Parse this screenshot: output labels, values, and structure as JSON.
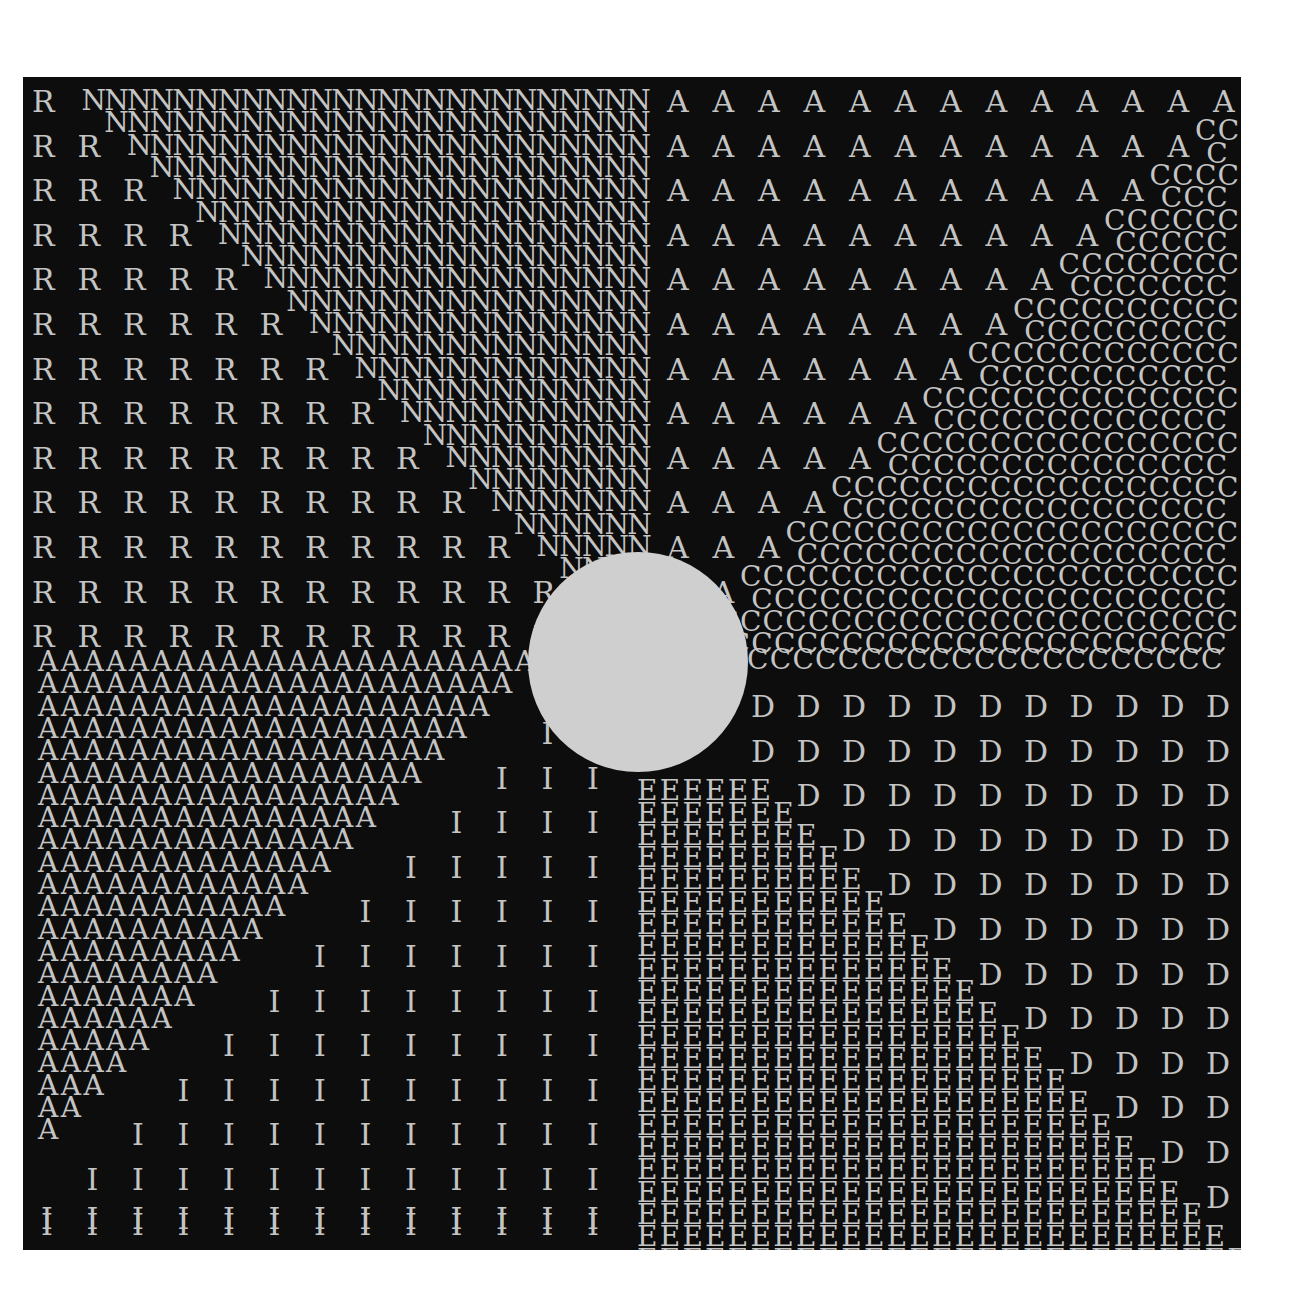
{
  "artwork": {
    "background": "#0d0d0d",
    "paper": "#ffffff",
    "ink": "#c4c4c4",
    "disc_color": "#cfcfcf",
    "panel": {
      "left": 23,
      "top": 77,
      "width": 1218,
      "height": 1173
    },
    "disc": {
      "cx": 638,
      "cy": 662,
      "r": 110
    },
    "quadrants": {
      "top_left": {
        "sparse_letter": "R",
        "dense_letter": "N",
        "rows": 13
      },
      "top_right": {
        "sparse_letter": "A",
        "dense_letter": "C",
        "rows": 13
      },
      "bottom_left": {
        "sparse_letter": "I",
        "dense_letter": "A",
        "rows": 13
      },
      "bottom_right": {
        "sparse_letter": "D",
        "dense_letter": "E",
        "rows": 13
      }
    },
    "layout": {
      "col_pitch_sparse": 45.5,
      "col_pitch_dense": 22.7,
      "row_pitch": 44.6,
      "half_row": 22.3,
      "font_size_sparse": 30,
      "font_size_dense": 28,
      "left_x": 38,
      "mid_x": 637,
      "right_x": 1228,
      "top_y": 95,
      "mid_y": 652,
      "bottom_y": 1240
    }
  }
}
